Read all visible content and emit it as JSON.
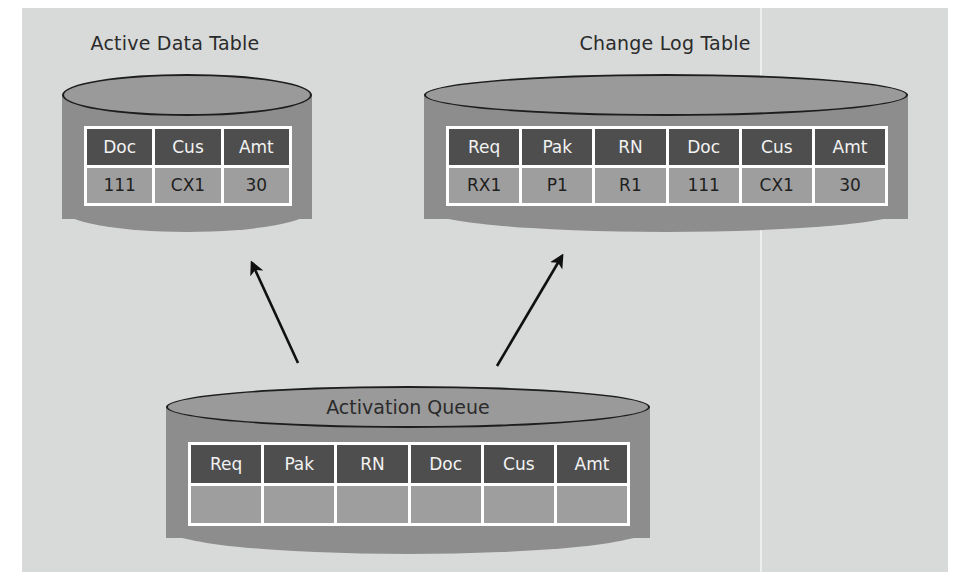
{
  "diagram": {
    "background_color": "#d8d9d9",
    "cylinder_body_color": "#8d8d8d",
    "header_cell_color": "#4e4e4e",
    "data_cell_color": "#9e9e9e",
    "grid_line_color": "#ffffff",
    "arrow_color": "#101010"
  },
  "active_data_table": {
    "title": "Active Data Table",
    "columns": [
      "Doc",
      "Cus",
      "Amt"
    ],
    "rows": [
      [
        "111",
        "CX1",
        "30"
      ]
    ]
  },
  "change_log_table": {
    "title": "Change Log Table",
    "columns": [
      "Req",
      "Pak",
      "RN",
      "Doc",
      "Cus",
      "Amt"
    ],
    "rows": [
      [
        "RX1",
        "P1",
        "R1",
        "111",
        "CX1",
        "30"
      ]
    ]
  },
  "activation_queue": {
    "title": "Activation Queue",
    "columns": [
      "Req",
      "Pak",
      "RN",
      "Doc",
      "Cus",
      "Amt"
    ],
    "rows": [
      [
        "",
        "",
        "",
        "",
        "",
        ""
      ]
    ]
  },
  "arrows": [
    {
      "name": "queue-to-active-data-table",
      "from": [
        276,
        355
      ],
      "to": [
        230,
        255
      ]
    },
    {
      "name": "queue-to-change-log-table",
      "from": [
        475,
        358
      ],
      "to": [
        540,
        248
      ]
    }
  ]
}
